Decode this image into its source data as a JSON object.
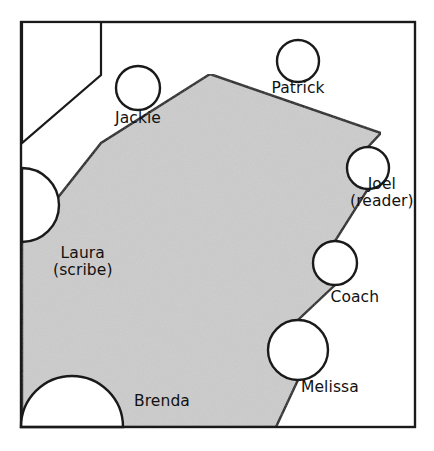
{
  "figure": {
    "type": "seating-diagram",
    "background_color": "#ffffff",
    "border_color": "#1a1a1a",
    "shaded_region_color": "#cccccc",
    "circle_fill_color": "#ffffff",
    "line_color": "#1a1a1a",
    "text_color": "#111111",
    "frame": {
      "x": 21,
      "y": 22,
      "width": 394,
      "height": 405
    }
  },
  "shaded_region": {
    "name": "table",
    "points": "210,74 101,143 22,243 22,427 276,427 298,380 298,320 335,285 335,241 368,189 368,147 381,133"
  },
  "white_region": {
    "name": "upper-left-notch",
    "points": "22,22 101,22 101,75 22,143"
  },
  "seats": [
    {
      "id": "jackie",
      "label": "Jackie",
      "shape": "circle",
      "cx": 138,
      "cy": 88,
      "r": 22,
      "label_x": 138,
      "label_y": 118,
      "label_align": "center"
    },
    {
      "id": "patrick",
      "label": "Patrick",
      "shape": "circle",
      "cx": 298,
      "cy": 61,
      "r": 21,
      "label_x": 298,
      "label_y": 88,
      "label_align": "center"
    },
    {
      "id": "joel",
      "label": "Joel\n(reader)",
      "shape": "circle",
      "cx": 368,
      "cy": 168,
      "r": 21,
      "label_x": 382,
      "label_y": 193,
      "label_align": "center"
    },
    {
      "id": "coach",
      "label": "Coach",
      "shape": "circle",
      "cx": 335,
      "cy": 263,
      "r": 22,
      "label_x": 355,
      "label_y": 297,
      "label_align": "center"
    },
    {
      "id": "melissa",
      "label": "Melissa",
      "shape": "circle",
      "cx": 298,
      "cy": 350,
      "r": 30,
      "label_x": 330,
      "label_y": 387,
      "label_align": "center"
    },
    {
      "id": "laura",
      "label": "Laura\n(scribe)",
      "shape": "half-circle-left",
      "cx": 22,
      "cy": 205,
      "r": 37,
      "label_x": 83,
      "label_y": 262,
      "label_align": "center"
    },
    {
      "id": "brenda",
      "label": "Brenda",
      "shape": "half-circle-bottom",
      "cx": 72,
      "cy": 427,
      "r": 51,
      "label_x": 162,
      "label_y": 401,
      "label_align": "center"
    }
  ]
}
